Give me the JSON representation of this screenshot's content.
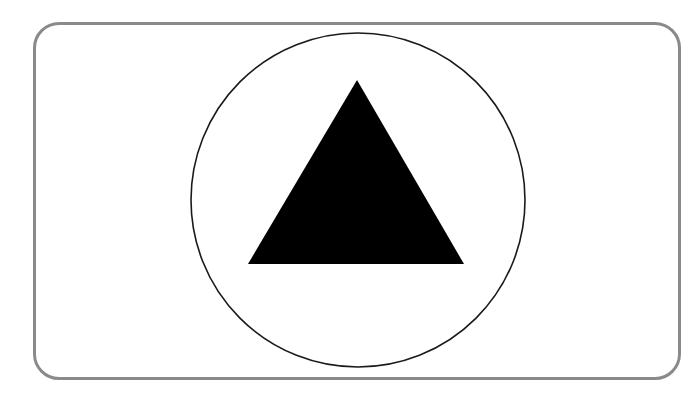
{
  "sign": {
    "shape": "triangle-in-circle",
    "frame_color": "#8a8a8a",
    "circle_stroke": "#1a1a1a",
    "triangle_fill": "#000000",
    "background": "#ffffff"
  }
}
